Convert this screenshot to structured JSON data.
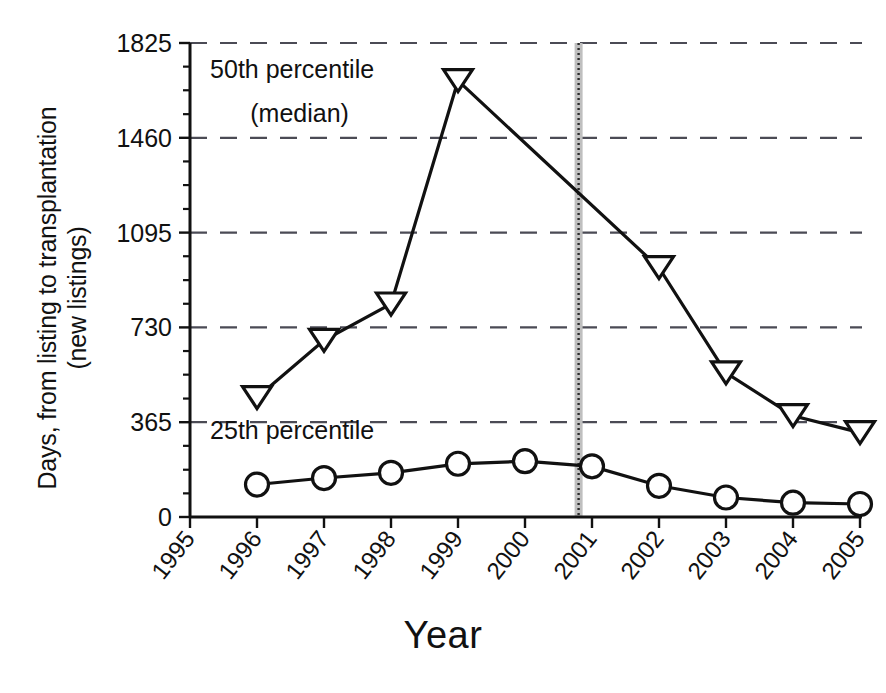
{
  "chart_data": {
    "type": "line",
    "title": "",
    "xlabel": "Year",
    "ylabel": "Days, from listing to transplantation\n(new listings)",
    "x": [
      1995,
      1996,
      1997,
      1998,
      1999,
      2000,
      2001,
      2002,
      2003,
      2004,
      2005
    ],
    "xtick_labels": [
      "1995",
      "1996",
      "1997",
      "1998",
      "1999",
      "2000",
      "2001",
      "2002",
      "2003",
      "2004",
      "2005"
    ],
    "ytick_labels": [
      "0",
      "365",
      "730",
      "1095",
      "1460",
      "1825"
    ],
    "yticks": [
      0,
      365,
      730,
      1095,
      1460,
      1825
    ],
    "ylim": [
      0,
      1825
    ],
    "y_minor_ticks": [
      91,
      182,
      274,
      456,
      548,
      639,
      821,
      912,
      1004,
      1186,
      1278,
      1369,
      1551,
      1643,
      1734
    ],
    "grid": "horizontal-dashed",
    "legend_position": "inline-annotations",
    "series": [
      {
        "name": "50th percentile (median)",
        "marker": "triangle-down",
        "x": [
          1996,
          1997,
          1998,
          1999,
          2002,
          2003,
          2004,
          2005
        ],
        "values": [
          460,
          680,
          820,
          1680,
          960,
          555,
          390,
          325
        ]
      },
      {
        "name": "25th percentile",
        "marker": "circle",
        "x": [
          1996,
          1997,
          1998,
          1999,
          2000,
          2001,
          2002,
          2003,
          2004,
          2005
        ],
        "values": [
          125,
          150,
          170,
          205,
          215,
          195,
          120,
          75,
          55,
          50
        ]
      }
    ],
    "annotations": [
      {
        "name": "median-label-line1",
        "text": "50th percentile",
        "x": 1995.3,
        "y": 1690
      },
      {
        "name": "median-label-line2",
        "text": "(median)",
        "x": 1995.9,
        "y": 1520
      },
      {
        "name": "p25-label",
        "text": "25th percentile",
        "x": 1995.3,
        "y": 300
      }
    ],
    "event_marker": {
      "name": "policy-change-marker",
      "label": "",
      "x": 2000.8,
      "style": "vertical-gray-dotted-band"
    }
  }
}
